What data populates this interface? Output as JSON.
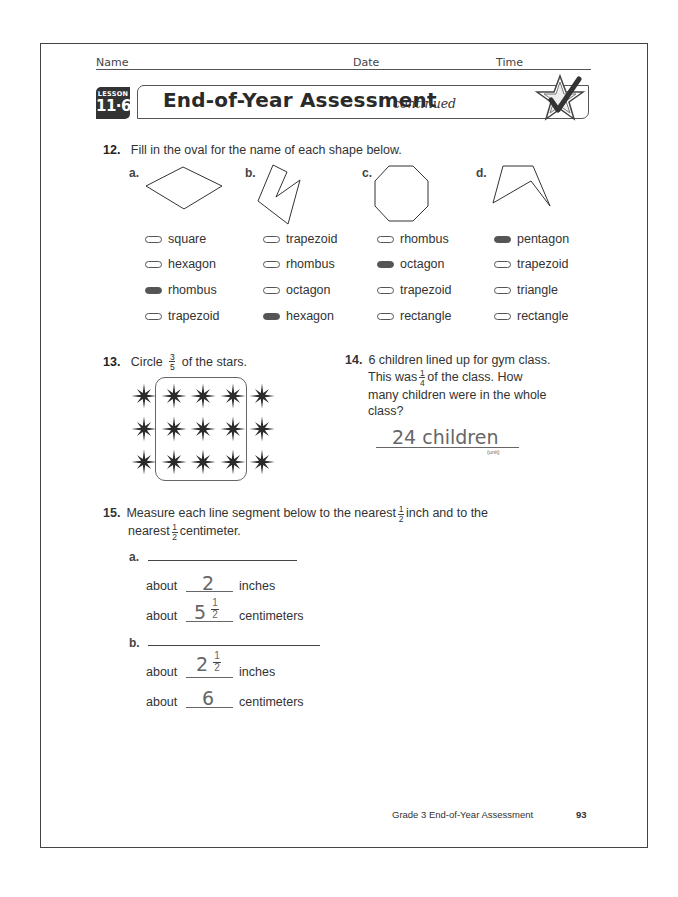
{
  "header": {
    "name_label": "Name",
    "date_label": "Date",
    "time_label": "Time",
    "lesson_label": "LESSON",
    "lesson_number": "11·6",
    "title": "End-of-Year Assessment",
    "title_suffix": "continued",
    "icon": "star-check-icon"
  },
  "q12": {
    "number": "12.",
    "prompt": "Fill in the oval for the name of each shape below.",
    "shapes": [
      {
        "letter": "a.",
        "shape": "rhombus",
        "options": [
          {
            "label": "square",
            "filled": false
          },
          {
            "label": "hexagon",
            "filled": false
          },
          {
            "label": "rhombus",
            "filled": true
          },
          {
            "label": "trapezoid",
            "filled": false
          }
        ]
      },
      {
        "letter": "b.",
        "shape": "hexagon",
        "options": [
          {
            "label": "trapezoid",
            "filled": false
          },
          {
            "label": "rhombus",
            "filled": false
          },
          {
            "label": "octagon",
            "filled": false
          },
          {
            "label": "hexagon",
            "filled": true
          }
        ]
      },
      {
        "letter": "c.",
        "shape": "octagon",
        "options": [
          {
            "label": "rhombus",
            "filled": false
          },
          {
            "label": "octagon",
            "filled": true
          },
          {
            "label": "trapezoid",
            "filled": false
          },
          {
            "label": "rectangle",
            "filled": false
          }
        ]
      },
      {
        "letter": "d.",
        "shape": "pentagon",
        "options": [
          {
            "label": "pentagon",
            "filled": true
          },
          {
            "label": "trapezoid",
            "filled": false
          },
          {
            "label": "triangle",
            "filled": false
          },
          {
            "label": "rectangle",
            "filled": false
          }
        ]
      }
    ]
  },
  "q13": {
    "number": "13.",
    "prompt_before": "Circle",
    "fraction": {
      "num": "3",
      "den": "5"
    },
    "prompt_after": "of the stars.",
    "rows": 3,
    "cols": 5,
    "circled_cols": [
      1,
      2,
      3
    ]
  },
  "q14": {
    "number": "14.",
    "line1": "6 children lined up for gym class.",
    "line2_before": "This was",
    "fraction": {
      "num": "1",
      "den": "4"
    },
    "line2_after": "of the class. How",
    "line3": "many children were in the whole",
    "line4": "class?",
    "answer": "24 children",
    "unit_label": "(unit)"
  },
  "q15": {
    "number": "15.",
    "line1_before": "Measure each line segment below to the nearest",
    "fraction": {
      "num": "1",
      "den": "2"
    },
    "line1_after": "inch and to the",
    "line2_before": "nearest",
    "line2_after": "centimeter.",
    "parts": [
      {
        "letter": "a.",
        "inches_prefix": "about",
        "inches_whole": "2",
        "inches_frac": null,
        "inches_unit": "inches",
        "cm_prefix": "about",
        "cm_whole": "5",
        "cm_frac": {
          "num": "1",
          "den": "2"
        },
        "cm_unit": "centimeters"
      },
      {
        "letter": "b.",
        "inches_prefix": "about",
        "inches_whole": "2",
        "inches_frac": {
          "num": "1",
          "den": "2"
        },
        "inches_unit": "inches",
        "cm_prefix": "about",
        "cm_whole": "6",
        "cm_frac": null,
        "cm_unit": "centimeters"
      }
    ]
  },
  "footer": {
    "text": "Grade 3 End-of-Year Assessment",
    "page_number": "93"
  }
}
